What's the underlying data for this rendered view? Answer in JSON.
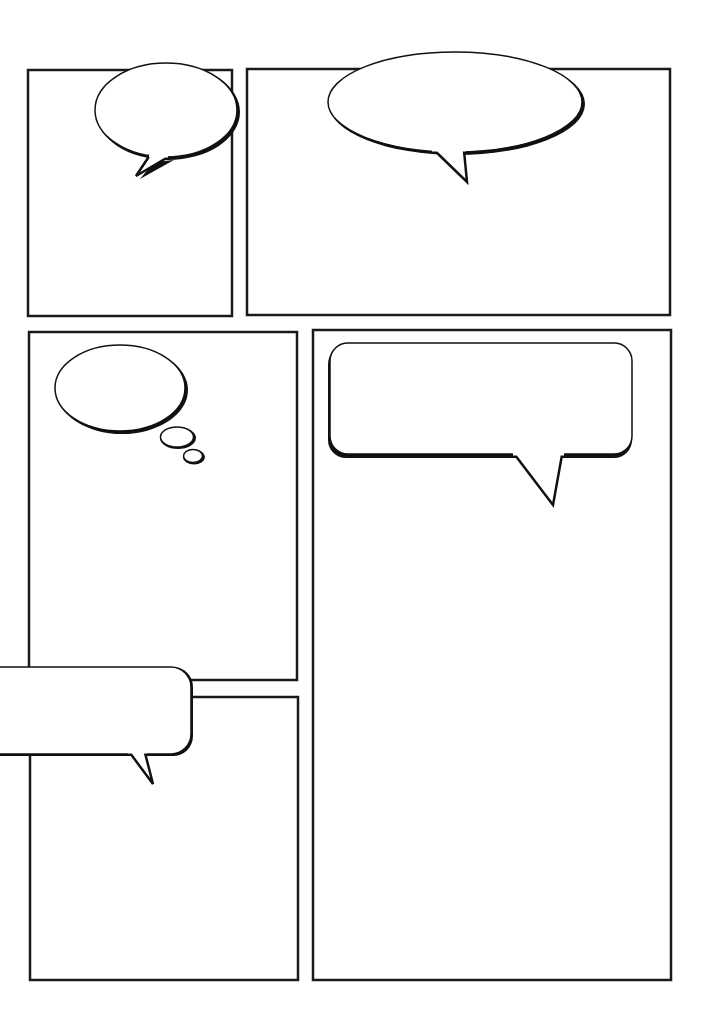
{
  "page": {
    "title": "Blank comic page template",
    "background": "#ffffff",
    "line_color": "#1a1a1a"
  },
  "panels": [
    {
      "id": "panel-1",
      "x": 28,
      "y": 70,
      "w": 204,
      "h": 246
    },
    {
      "id": "panel-2",
      "x": 247,
      "y": 69,
      "w": 423,
      "h": 246
    },
    {
      "id": "panel-3",
      "x": 29,
      "y": 332,
      "w": 268,
      "h": 348
    },
    {
      "id": "panel-4",
      "x": 313,
      "y": 330,
      "w": 358,
      "h": 650
    },
    {
      "id": "panel-5",
      "x": 30,
      "y": 697,
      "w": 268,
      "h": 283
    }
  ],
  "bubbles": [
    {
      "id": "speech-oval-1",
      "type": "speech-oval",
      "text": ""
    },
    {
      "id": "speech-oval-2",
      "type": "speech-oval",
      "text": ""
    },
    {
      "id": "thought-bubble",
      "type": "thought",
      "text": ""
    },
    {
      "id": "speech-rect-1",
      "type": "speech-rounded-rect",
      "text": ""
    },
    {
      "id": "speech-rect-2",
      "type": "speech-rounded-rect",
      "text": ""
    }
  ]
}
